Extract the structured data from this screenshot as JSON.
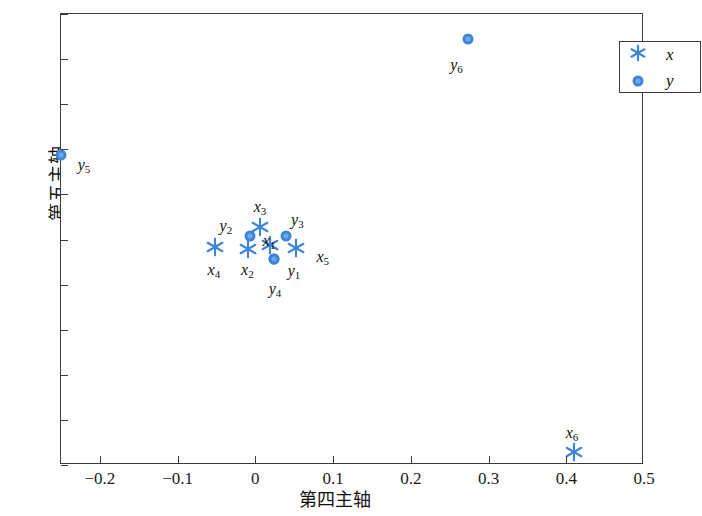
{
  "chart": {
    "type": "scatter",
    "title": "",
    "xlabel": "第四主轴",
    "ylabel": "第五主轴",
    "xlim": [
      -0.25,
      0.5
    ],
    "ylim": [
      -0.25,
      0.25
    ],
    "grid": false,
    "legend_position": "top-right"
  },
  "axes": {
    "x_ticks": [
      {
        "value": -0.2,
        "label": "−0.2"
      },
      {
        "value": -0.1,
        "label": "−0.1"
      },
      {
        "value": 0,
        "label": "0"
      },
      {
        "value": 0.1,
        "label": "0.1"
      },
      {
        "value": 0.2,
        "label": "0.2"
      },
      {
        "value": 0.3,
        "label": "0.3"
      },
      {
        "value": 0.4,
        "label": "0.4"
      },
      {
        "value": 0.5,
        "label": "0.5"
      }
    ],
    "y_ticks": [
      {
        "value": 0.25,
        "label": "0.25"
      },
      {
        "value": 0.2,
        "label": "0.20"
      },
      {
        "value": 0.15,
        "label": "0.15"
      },
      {
        "value": 0.1,
        "label": "0.10"
      },
      {
        "value": 0.05,
        "label": "0.05"
      },
      {
        "value": 0,
        "label": "0"
      },
      {
        "value": -0.05,
        "label": "−0.05"
      },
      {
        "value": -0.1,
        "label": "−0.10"
      },
      {
        "value": -0.15,
        "label": "−0.15"
      },
      {
        "value": -0.2,
        "label": "−0.20"
      },
      {
        "value": -0.25,
        "label": "−0.25"
      }
    ]
  },
  "legend": {
    "items": [
      {
        "marker": "asterisk",
        "label": "x",
        "color": "#3d85d8"
      },
      {
        "marker": "circle",
        "label": "y",
        "color": "#3d85d8"
      }
    ]
  },
  "chart_data": {
    "type": "scatter",
    "title": "",
    "xlabel": "第四主轴",
    "ylabel": "第五主轴",
    "xlim": [
      -0.25,
      0.5
    ],
    "ylim": [
      -0.25,
      0.25
    ],
    "grid": false,
    "legend": [
      "x",
      "y"
    ],
    "series": [
      {
        "name": "x",
        "marker": "asterisk",
        "color": "#3d85d8",
        "points": [
          {
            "label": "x1",
            "label_text": "x",
            "sub": "1",
            "x": 0.019,
            "y": -0.006,
            "label_dx": -1,
            "label_dy": -4
          },
          {
            "label": "x2",
            "label_text": "x",
            "sub": "2",
            "x": -0.009,
            "y": -0.01,
            "label_dx": -1,
            "label_dy": 21
          },
          {
            "label": "x3",
            "label_text": "x",
            "sub": "3",
            "x": 0.006,
            "y": 0.014,
            "label_dx": 0,
            "label_dy": -20
          },
          {
            "label": "x4",
            "label_text": "x",
            "sub": "4",
            "x": -0.052,
            "y": -0.008,
            "label_dx": -1,
            "label_dy": 23
          },
          {
            "label": "x5",
            "label_text": "x",
            "sub": "5",
            "x": 0.052,
            "y": -0.009,
            "label_dx": 27,
            "label_dy": 9
          },
          {
            "label": "x6",
            "label_text": "x",
            "sub": "6",
            "x": 0.41,
            "y": -0.236,
            "label_dx": -2,
            "label_dy": -19
          }
        ]
      },
      {
        "name": "y",
        "marker": "circle",
        "color": "#3d85d8",
        "points": [
          {
            "label": "y1",
            "label_text": "y",
            "sub": "1",
            "x": 0.024,
            "y": -0.022,
            "label_dx": 20,
            "label_dy": 12
          },
          {
            "label": "y2",
            "label_text": "y",
            "sub": "2",
            "x": -0.007,
            "y": 0.004,
            "label_dx": -24,
            "label_dy": -10
          },
          {
            "label": "y3",
            "label_text": "y",
            "sub": "3",
            "x": 0.04,
            "y": 0.004,
            "label_dx": 11,
            "label_dy": -16
          },
          {
            "label": "y4",
            "label_text": "y",
            "sub": "4",
            "x": 0.024,
            "y": -0.022,
            "label_dx": 1,
            "label_dy": 30
          },
          {
            "label": "y5",
            "label_text": "y",
            "sub": "5",
            "x": -0.25,
            "y": 0.094,
            "label_dx": 23,
            "label_dy": 10
          },
          {
            "label": "y6",
            "label_text": "y",
            "sub": "6",
            "x": 0.273,
            "y": 0.222,
            "label_dx": -11,
            "label_dy": 26
          }
        ]
      }
    ]
  }
}
